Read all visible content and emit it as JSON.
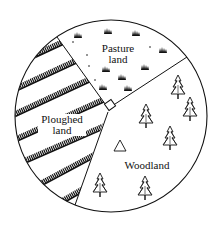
{
  "diagram": {
    "type": "land-use-circle",
    "regions": [
      {
        "id": "pasture",
        "label_line1": "Pasture",
        "label_line2": "land"
      },
      {
        "id": "ploughed",
        "label_line1": "Ploughed",
        "label_line2": "land"
      },
      {
        "id": "woodland",
        "label_line1": "Woodland",
        "label_line2": ""
      }
    ],
    "colors": {
      "ink": "#111111",
      "background": "#ffffff"
    }
  }
}
